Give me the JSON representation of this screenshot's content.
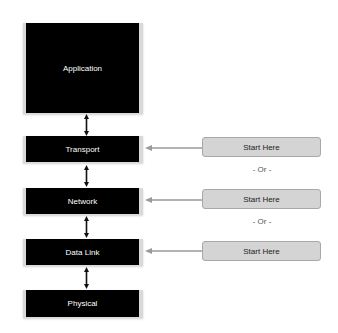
{
  "layers": [
    {
      "label": "Application"
    },
    {
      "label": "Transport"
    },
    {
      "label": "Network"
    },
    {
      "label": "Data Link"
    },
    {
      "label": "Physical"
    }
  ],
  "start_buttons": [
    {
      "label": "Start Here",
      "target": "Transport"
    },
    {
      "label": "Start Here",
      "target": "Network"
    },
    {
      "label": "Start Here",
      "target": "Data Link"
    }
  ],
  "separators": [
    {
      "label": "- Or -"
    },
    {
      "label": "- Or -"
    }
  ],
  "icons": {
    "vertical_link": "double-headed-vertical-arrow",
    "horizontal_link": "left-arrow"
  },
  "colors": {
    "layer_fill": "#000000",
    "layer_frame": "#d9d9d9",
    "layer_text": "#ffffff",
    "button_fill": "#d4d4d4",
    "button_border": "#a8a8a8",
    "arrow": "#9a9a9a"
  }
}
